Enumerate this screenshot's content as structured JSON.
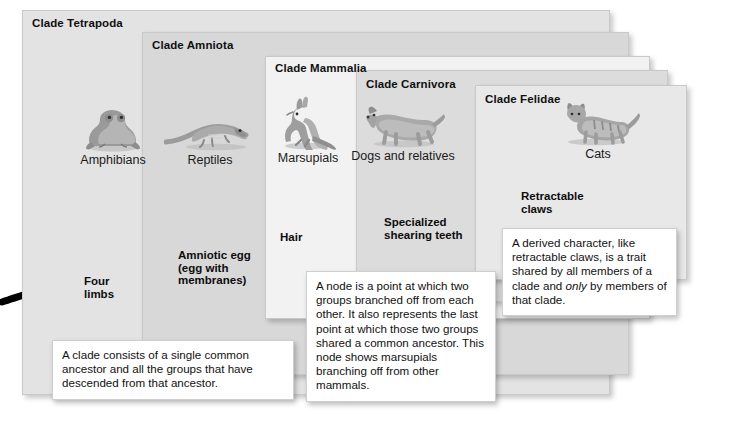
{
  "diagram": {
    "background": "#ffffff"
  },
  "clades": [
    {
      "name": "Clade Tetrapoda",
      "fill": "#e3e3e3",
      "x": 22,
      "y": 10,
      "w": 588,
      "h": 385,
      "title_x": 32,
      "title_y": 17
    },
    {
      "name": "Clade Amniota",
      "fill": "#d8d8d8",
      "x": 142,
      "y": 32,
      "w": 487,
      "h": 343,
      "title_x": 152,
      "title_y": 39
    },
    {
      "name": "Clade Mammalia",
      "fill": "#f2f2f2",
      "x": 265,
      "y": 56,
      "w": 385,
      "h": 263,
      "title_x": 275,
      "title_y": 62
    },
    {
      "name": "Clade Carnivora",
      "fill": "#dcdcdc",
      "x": 356,
      "y": 70,
      "w": 312,
      "h": 232,
      "title_x": 366,
      "title_y": 78
    },
    {
      "name": "Clade Felidae",
      "fill": "#e8e8e8",
      "x": 475,
      "y": 85,
      "w": 212,
      "h": 195,
      "title_x": 485,
      "title_y": 93
    }
  ],
  "taxa": [
    {
      "label": "Amphibians",
      "icon": "frog-icon",
      "x": 58,
      "y": 100
    },
    {
      "label": "Reptiles",
      "icon": "lizard-icon",
      "x": 155,
      "y": 100
    },
    {
      "label": "Marsupials",
      "icon": "kangaroo-icon",
      "x": 253,
      "y": 98
    },
    {
      "label": "Dogs and relatives",
      "icon": "dog-icon",
      "x": 348,
      "y": 96
    },
    {
      "label": "Cats",
      "icon": "cat-icon",
      "x": 543,
      "y": 94
    }
  ],
  "nodes": [
    {
      "label": "Four limbs",
      "x": 70,
      "y": 268,
      "label_x": 84,
      "label_y": 275
    },
    {
      "label": "Amniotic egg\n(egg with\nmembranes)",
      "x": 169,
      "y": 243,
      "label_x": 178,
      "label_y": 249
    },
    {
      "label": "Hair",
      "x": 287,
      "y": 225,
      "label_x": 280,
      "label_y": 231
    },
    {
      "label": "Specialized\nshearing teeth",
      "x": 390,
      "y": 210,
      "label_x": 384,
      "label_y": 216
    },
    {
      "label": "Retractable\nclaws",
      "x": 506,
      "y": 194,
      "label_x": 521,
      "label_y": 190
    }
  ],
  "node_label_lines": {
    "four_limbs": [
      "Four",
      "limbs"
    ],
    "amniotic_egg": [
      "Amniotic egg",
      "(egg with",
      "membranes)"
    ],
    "hair": [
      "Hair"
    ],
    "shearing_teeth": [
      "Specialized",
      "shearing teeth"
    ],
    "retractable": [
      "Retractable",
      "claws"
    ]
  },
  "callouts": [
    {
      "id": "clade-definition",
      "text": "A clade consists of a single common ancestor and all the groups that have descended from that ancestor.",
      "x": 52,
      "y": 340,
      "w": 242,
      "h": 58
    },
    {
      "id": "node-definition",
      "text": "A node is a point at which two groups branched off from each other. It also represents the last point at which those two groups shared a common ancestor. This node shows marsupials branching off from other mammals.",
      "x": 306,
      "y": 271,
      "w": 190,
      "h": 122
    },
    {
      "id": "derived-character-definition",
      "text_parts": [
        {
          "t": "A derived character, like retractable claws, is a trait shared by all members of a clade and ",
          "i": false
        },
        {
          "t": "only",
          "i": true
        },
        {
          "t": " by members of that clade.",
          "i": false
        }
      ],
      "x": 502,
      "y": 228,
      "w": 175,
      "h": 86
    }
  ],
  "trunk": {
    "color": "#000000",
    "stroke_width": 7,
    "path": "M 2 302 C 40 290 120 262 180 248 C 260 230 330 216 400 205 C 450 197 480 194 506 192 C 530 188 548 175 560 160"
  },
  "branches": [
    {
      "from": "Four limbs node",
      "icon": "branch-amphibians",
      "path": "M 106 168 C 102 200 92 236 78 266"
    },
    {
      "from": "Amniotic node",
      "icon": "branch-reptiles",
      "path": "M 198 168 C 194 196 184 222 176 246"
    },
    {
      "from": "Hair node",
      "icon": "branch-marsupials",
      "path": "M 301 166 C 299 192 299 210 299 227"
    },
    {
      "from": "Shearing node",
      "icon": "branch-dogs",
      "path": "M 404 162 C 401 182 399 196 397 209"
    }
  ]
}
